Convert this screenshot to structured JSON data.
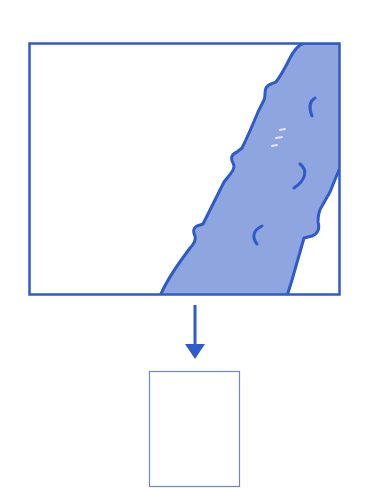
{
  "diagram": {
    "colors": {
      "background": "#ffffff",
      "stroke": "#2f5bc8",
      "fill": "#8fa5e0",
      "highlight": "#dfe6fb",
      "thin_frame": "#6f86d6"
    },
    "source_frame": {
      "x": 29,
      "y": 43,
      "width": 311,
      "height": 252
    },
    "arrow": {
      "x": 195,
      "y_start": 305,
      "y_end": 359,
      "direction": "down"
    },
    "target_frame": {
      "x": 149,
      "y": 371,
      "width": 91,
      "height": 116
    }
  }
}
